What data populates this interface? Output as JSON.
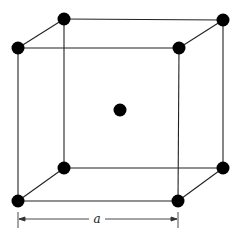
{
  "diagram": {
    "dimension_label": "a",
    "colors": {
      "line": "#222222",
      "atom": "#000000",
      "background": "#ffffff"
    },
    "atoms": {
      "front_top_left": [
        18,
        48
      ],
      "front_top_right": [
        179,
        48
      ],
      "front_bottom_left": [
        18,
        201
      ],
      "front_bottom_right": [
        178,
        201
      ],
      "back_top_left": [
        64,
        19
      ],
      "back_top_right": [
        223,
        20
      ],
      "back_bottom_left": [
        64,
        168
      ],
      "back_bottom_right": [
        223,
        168
      ],
      "body_center": [
        120,
        110
      ]
    }
  }
}
